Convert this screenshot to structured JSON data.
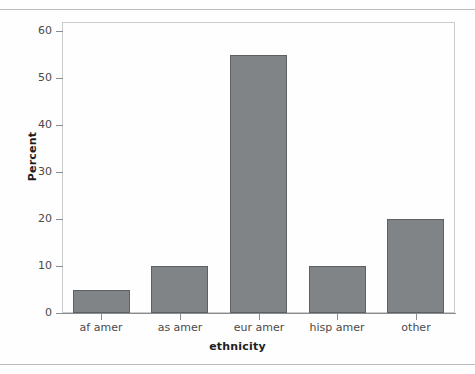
{
  "chart_data": {
    "type": "bar",
    "title": "",
    "xlabel": "ethnicity",
    "ylabel": "Percent",
    "categories": [
      "af amer",
      "as amer",
      "eur amer",
      "hisp amer",
      "other"
    ],
    "values": [
      5,
      10,
      55,
      10,
      20
    ],
    "ylim": [
      0,
      62
    ],
    "yticks": [
      0,
      10,
      20,
      30,
      40,
      50,
      60
    ],
    "ytick_labels": [
      "0",
      "10",
      "20",
      "30",
      "40",
      "50",
      "60"
    ],
    "grid": false,
    "legend": false,
    "bar_color": "#808486",
    "bar_border_color": "#5e6163",
    "axis_color": "#8a8d8f",
    "frame_color": "#c9cbcc",
    "background": "#fefefe",
    "text_color": "#4a4a4a",
    "title_color": "#1d1d1d"
  }
}
